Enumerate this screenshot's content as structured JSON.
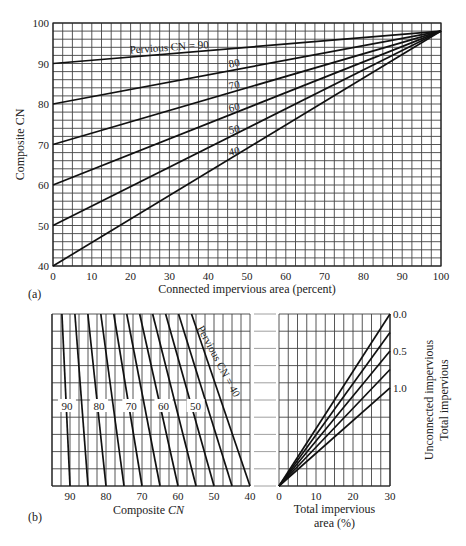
{
  "chart_data": [
    {
      "id": "a",
      "panel_label": "(a)",
      "type": "line",
      "title": "",
      "xlabel": "Connected impervious area (percent)",
      "ylabel": "Composite CN",
      "xlim": [
        0,
        100
      ],
      "ylim": [
        40,
        100
      ],
      "x_ticks": [
        0,
        10,
        20,
        30,
        40,
        50,
        60,
        70,
        80,
        90,
        100
      ],
      "y_ticks": [
        40,
        50,
        60,
        70,
        80,
        90,
        100
      ],
      "x_tick_labels": [
        "0",
        "10",
        "20",
        "30",
        "40",
        "50",
        "60",
        "70",
        "80",
        "90",
        "100"
      ],
      "y_tick_labels": [
        "40",
        "50",
        "60",
        "70",
        "80",
        "90",
        "100"
      ],
      "grid": true,
      "grid_x_step": 2.5,
      "grid_y_step": 2,
      "impervious_cn": 98,
      "series": [
        {
          "name": "Pervious CN = 90",
          "label": "Pervious CN = 90",
          "x": [
            0,
            100
          ],
          "y": [
            90,
            98
          ]
        },
        {
          "name": "80",
          "label": "80",
          "x": [
            0,
            100
          ],
          "y": [
            80,
            98
          ]
        },
        {
          "name": "70",
          "label": "70",
          "x": [
            0,
            100
          ],
          "y": [
            70,
            98
          ]
        },
        {
          "name": "60",
          "label": "60",
          "x": [
            0,
            100
          ],
          "y": [
            60,
            98
          ]
        },
        {
          "name": "50",
          "label": "50",
          "x": [
            0,
            100
          ],
          "y": [
            50,
            98
          ]
        },
        {
          "name": "40",
          "label": "40",
          "x": [
            0,
            100
          ],
          "y": [
            40,
            98
          ]
        }
      ]
    },
    {
      "id": "b-left",
      "panel_label": "(b)",
      "type": "line",
      "title": "",
      "xlabel": "Composite CN",
      "ylabel": "",
      "xlim": [
        95,
        40
      ],
      "x_ticks": [
        90,
        80,
        70,
        60,
        50,
        40
      ],
      "x_tick_labels": [
        "90",
        "80",
        "70",
        "60",
        "50",
        "40"
      ],
      "grid": true,
      "grid_x_step": 2.5,
      "series_labels": [
        "90",
        "80",
        "70",
        "60",
        "50"
      ],
      "rotated_label": "Pervious CN = 40",
      "pervious_cn_lines": [
        90,
        85,
        80,
        75,
        70,
        65,
        60,
        55,
        50,
        45,
        40
      ]
    },
    {
      "id": "b-right",
      "type": "line",
      "title": "",
      "xlabel": "Total impervious area (%)",
      "xlabel_lines": [
        "Total impervious",
        "area (%)"
      ],
      "ylabel_right_lines": [
        "Unconnected impervious",
        "Total impervious"
      ],
      "xlim": [
        0,
        30
      ],
      "x_ticks": [
        0,
        10,
        20,
        30
      ],
      "x_tick_labels": [
        "0",
        "10",
        "20",
        "30"
      ],
      "grid": true,
      "grid_x_step": 2.5,
      "ratio_labels": [
        "0.0",
        "0.5",
        "1.0"
      ],
      "series": [
        {
          "name": "ratio 0.0",
          "ratio": 0.0,
          "x": [
            0,
            30
          ]
        },
        {
          "name": "ratio 0.25",
          "ratio": 0.25,
          "x": [
            0,
            30
          ]
        },
        {
          "name": "ratio 0.5",
          "ratio": 0.5,
          "x": [
            0,
            30
          ]
        },
        {
          "name": "ratio 0.75",
          "ratio": 0.75,
          "x": [
            0,
            30
          ]
        },
        {
          "name": "ratio 1.0",
          "ratio": 1.0,
          "x": [
            0,
            30
          ]
        }
      ]
    }
  ]
}
